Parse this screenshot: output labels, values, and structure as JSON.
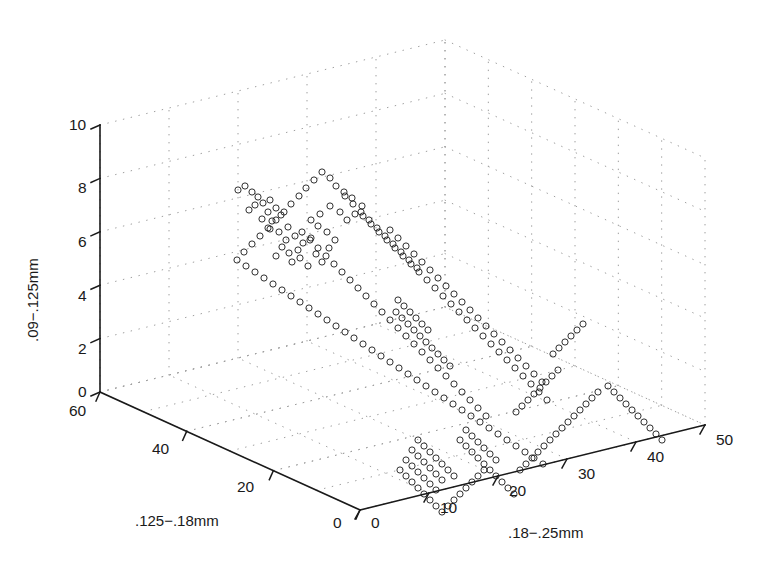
{
  "figure": {
    "kind": "matlab-3d-scatter",
    "background_color": "#ffffff",
    "axis_color": "#1a1a1a",
    "grid_color": "#9a9a9a",
    "marker_color": "#1a1a1a",
    "marker_shape": "open-circle",
    "marker_radius_px": 3.1,
    "marker_stroke_px": 0.9
  },
  "axes": {
    "x": {
      "title": ".125−.18mm",
      "ticks": [
        60,
        40,
        20,
        0
      ],
      "tick_labels": [
        "60",
        "40",
        "20",
        "0"
      ],
      "lim": [
        0,
        60
      ]
    },
    "y": {
      "title": ".18−.25mm",
      "ticks": [
        0,
        10,
        20,
        30,
        40,
        50
      ],
      "tick_labels": [
        "0",
        "10",
        "20",
        "30",
        "40",
        "50"
      ],
      "lim": [
        0,
        50
      ]
    },
    "z": {
      "title": ".09−.125mm",
      "ticks": [
        0,
        2,
        4,
        6,
        8,
        10
      ],
      "tick_labels": [
        "0",
        "2",
        "4",
        "6",
        "8",
        "10"
      ],
      "lim": [
        0,
        10
      ]
    }
  },
  "chart_data": {
    "type": "scatter",
    "title": "",
    "xlabel": ".125−.18mm",
    "ylabel": ".18−.25mm",
    "zlabel": ".09−.125mm",
    "xlim": [
      0,
      60
    ],
    "ylim": [
      0,
      50
    ],
    "zlim": [
      0,
      10
    ],
    "grid": true,
    "legend": "none",
    "dimensions": 3,
    "n_points": 268,
    "points_screen": [
      [
        238,
        190
      ],
      [
        245,
        186
      ],
      [
        252,
        192
      ],
      [
        258,
        197
      ],
      [
        263,
        203
      ],
      [
        270,
        200
      ],
      [
        276,
        208
      ],
      [
        268,
        212
      ],
      [
        255,
        205
      ],
      [
        249,
        210
      ],
      [
        262,
        219
      ],
      [
        272,
        221
      ],
      [
        281,
        215
      ],
      [
        288,
        227
      ],
      [
        279,
        232
      ],
      [
        270,
        229
      ],
      [
        286,
        240
      ],
      [
        295,
        236
      ],
      [
        303,
        243
      ],
      [
        311,
        238
      ],
      [
        298,
        250
      ],
      [
        289,
        253
      ],
      [
        282,
        247
      ],
      [
        276,
        256
      ],
      [
        292,
        262
      ],
      [
        300,
        258
      ],
      [
        308,
        266
      ],
      [
        316,
        254
      ],
      [
        322,
        262
      ],
      [
        329,
        248
      ],
      [
        335,
        240
      ],
      [
        327,
        232
      ],
      [
        318,
        226
      ],
      [
        311,
        220
      ],
      [
        320,
        214
      ],
      [
        330,
        206
      ],
      [
        340,
        212
      ],
      [
        347,
        220
      ],
      [
        355,
        214
      ],
      [
        362,
        206
      ],
      [
        352,
        198
      ],
      [
        344,
        192
      ],
      [
        336,
        186
      ],
      [
        330,
        178
      ],
      [
        322,
        172
      ],
      [
        314,
        180
      ],
      [
        306,
        188
      ],
      [
        299,
        196
      ],
      [
        291,
        204
      ],
      [
        284,
        212
      ],
      [
        276,
        220
      ],
      [
        268,
        228
      ],
      [
        260,
        236
      ],
      [
        252,
        244
      ],
      [
        244,
        252
      ],
      [
        237,
        260
      ],
      [
        246,
        266
      ],
      [
        255,
        272
      ],
      [
        264,
        278
      ],
      [
        273,
        284
      ],
      [
        282,
        290
      ],
      [
        291,
        296
      ],
      [
        300,
        302
      ],
      [
        309,
        308
      ],
      [
        318,
        314
      ],
      [
        327,
        320
      ],
      [
        336,
        326
      ],
      [
        345,
        332
      ],
      [
        354,
        338
      ],
      [
        363,
        344
      ],
      [
        372,
        350
      ],
      [
        381,
        356
      ],
      [
        390,
        362
      ],
      [
        399,
        368
      ],
      [
        408,
        374
      ],
      [
        417,
        380
      ],
      [
        426,
        386
      ],
      [
        435,
        392
      ],
      [
        444,
        398
      ],
      [
        453,
        404
      ],
      [
        462,
        410
      ],
      [
        471,
        416
      ],
      [
        480,
        422
      ],
      [
        489,
        428
      ],
      [
        498,
        434
      ],
      [
        507,
        440
      ],
      [
        516,
        446
      ],
      [
        525,
        452
      ],
      [
        534,
        458
      ],
      [
        543,
        464
      ],
      [
        363,
        216
      ],
      [
        371,
        224
      ],
      [
        379,
        232
      ],
      [
        387,
        240
      ],
      [
        395,
        248
      ],
      [
        403,
        256
      ],
      [
        411,
        264
      ],
      [
        419,
        272
      ],
      [
        427,
        280
      ],
      [
        435,
        288
      ],
      [
        443,
        296
      ],
      [
        451,
        304
      ],
      [
        459,
        312
      ],
      [
        467,
        320
      ],
      [
        475,
        328
      ],
      [
        483,
        336
      ],
      [
        491,
        344
      ],
      [
        499,
        352
      ],
      [
        507,
        360
      ],
      [
        515,
        368
      ],
      [
        523,
        376
      ],
      [
        531,
        384
      ],
      [
        539,
        392
      ],
      [
        547,
        400
      ],
      [
        390,
        230
      ],
      [
        398,
        238
      ],
      [
        406,
        246
      ],
      [
        414,
        254
      ],
      [
        422,
        262
      ],
      [
        430,
        270
      ],
      [
        438,
        278
      ],
      [
        446,
        286
      ],
      [
        454,
        294
      ],
      [
        462,
        302
      ],
      [
        470,
        310
      ],
      [
        478,
        318
      ],
      [
        486,
        326
      ],
      [
        494,
        334
      ],
      [
        502,
        342
      ],
      [
        510,
        350
      ],
      [
        518,
        358
      ],
      [
        526,
        366
      ],
      [
        534,
        374
      ],
      [
        542,
        382
      ],
      [
        345,
        196
      ],
      [
        353,
        204
      ],
      [
        361,
        212
      ],
      [
        369,
        220
      ],
      [
        377,
        228
      ],
      [
        385,
        236
      ],
      [
        393,
        244
      ],
      [
        401,
        252
      ],
      [
        409,
        260
      ],
      [
        417,
        268
      ],
      [
        302,
        232
      ],
      [
        310,
        240
      ],
      [
        318,
        248
      ],
      [
        326,
        256
      ],
      [
        334,
        264
      ],
      [
        342,
        272
      ],
      [
        350,
        280
      ],
      [
        358,
        288
      ],
      [
        366,
        296
      ],
      [
        374,
        304
      ],
      [
        382,
        312
      ],
      [
        390,
        320
      ],
      [
        398,
        328
      ],
      [
        406,
        336
      ],
      [
        414,
        344
      ],
      [
        422,
        352
      ],
      [
        430,
        360
      ],
      [
        438,
        368
      ],
      [
        446,
        376
      ],
      [
        454,
        384
      ],
      [
        462,
        392
      ],
      [
        470,
        400
      ],
      [
        478,
        408
      ],
      [
        486,
        416
      ],
      [
        398,
        300
      ],
      [
        404,
        306
      ],
      [
        410,
        312
      ],
      [
        416,
        318
      ],
      [
        422,
        324
      ],
      [
        428,
        330
      ],
      [
        396,
        312
      ],
      [
        402,
        318
      ],
      [
        408,
        324
      ],
      [
        414,
        330
      ],
      [
        420,
        336
      ],
      [
        426,
        342
      ],
      [
        432,
        348
      ],
      [
        438,
        354
      ],
      [
        444,
        360
      ],
      [
        450,
        366
      ],
      [
        418,
        440
      ],
      [
        424,
        446
      ],
      [
        430,
        452
      ],
      [
        436,
        458
      ],
      [
        442,
        464
      ],
      [
        448,
        470
      ],
      [
        454,
        476
      ],
      [
        412,
        450
      ],
      [
        418,
        456
      ],
      [
        424,
        462
      ],
      [
        430,
        468
      ],
      [
        436,
        474
      ],
      [
        442,
        480
      ],
      [
        406,
        460
      ],
      [
        412,
        466
      ],
      [
        418,
        472
      ],
      [
        424,
        478
      ],
      [
        430,
        484
      ],
      [
        436,
        490
      ],
      [
        400,
        470
      ],
      [
        406,
        476
      ],
      [
        412,
        482
      ],
      [
        418,
        488
      ],
      [
        424,
        494
      ],
      [
        466,
        430
      ],
      [
        472,
        436
      ],
      [
        478,
        442
      ],
      [
        484,
        448
      ],
      [
        490,
        454
      ],
      [
        496,
        460
      ],
      [
        460,
        440
      ],
      [
        466,
        446
      ],
      [
        472,
        452
      ],
      [
        478,
        458
      ],
      [
        484,
        464
      ],
      [
        490,
        470
      ],
      [
        496,
        476
      ],
      [
        502,
        482
      ],
      [
        508,
        488
      ],
      [
        514,
        494
      ],
      [
        520,
        470
      ],
      [
        526,
        464
      ],
      [
        532,
        458
      ],
      [
        538,
        452
      ],
      [
        544,
        446
      ],
      [
        550,
        440
      ],
      [
        556,
        434
      ],
      [
        562,
        428
      ],
      [
        568,
        422
      ],
      [
        574,
        416
      ],
      [
        580,
        410
      ],
      [
        586,
        404
      ],
      [
        592,
        398
      ],
      [
        598,
        392
      ],
      [
        553,
        354
      ],
      [
        559,
        348
      ],
      [
        565,
        342
      ],
      [
        571,
        336
      ],
      [
        577,
        330
      ],
      [
        583,
        324
      ],
      [
        516,
        412
      ],
      [
        522,
        406
      ],
      [
        528,
        400
      ],
      [
        534,
        394
      ],
      [
        540,
        388
      ],
      [
        546,
        382
      ],
      [
        552,
        376
      ],
      [
        558,
        370
      ],
      [
        608,
        386
      ],
      [
        614,
        392
      ],
      [
        620,
        398
      ],
      [
        626,
        404
      ],
      [
        632,
        410
      ],
      [
        638,
        416
      ],
      [
        644,
        422
      ],
      [
        650,
        428
      ],
      [
        656,
        434
      ],
      [
        662,
        440
      ],
      [
        430,
        500
      ],
      [
        436,
        506
      ],
      [
        442,
        512
      ],
      [
        448,
        506
      ],
      [
        454,
        500
      ],
      [
        460,
        494
      ],
      [
        466,
        488
      ],
      [
        472,
        482
      ],
      [
        478,
        476
      ],
      [
        484,
        470
      ]
    ]
  }
}
